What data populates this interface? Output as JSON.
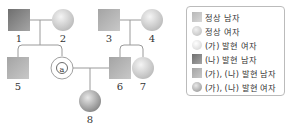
{
  "pedigree": {
    "individuals": [
      {
        "id": "1",
        "label": "1",
        "sex": "male",
        "phenotype": "(나) 발현 남자"
      },
      {
        "id": "2",
        "label": "2",
        "sex": "female",
        "phenotype": "정상 여자"
      },
      {
        "id": "3",
        "label": "3",
        "sex": "male",
        "phenotype": "(가), (나) 발현 남자"
      },
      {
        "id": "4",
        "label": "4",
        "sex": "female",
        "phenotype": "정상 여자"
      },
      {
        "id": "5",
        "label": "5",
        "sex": "male",
        "phenotype": "(가), (나) 발현 남자"
      },
      {
        "id": "a",
        "label": "ⓐ",
        "sex": "female",
        "phenotype": "unknown"
      },
      {
        "id": "6",
        "label": "6",
        "sex": "male",
        "phenotype": "(가), (나) 발현 남자"
      },
      {
        "id": "7",
        "label": "7",
        "sex": "female",
        "phenotype": "정상 여자"
      },
      {
        "id": "8",
        "label": "8",
        "sex": "female",
        "phenotype": "(가), (나) 발현 여자"
      }
    ],
    "marriages": [
      [
        "1",
        "2"
      ],
      [
        "3",
        "4"
      ],
      [
        "a",
        "6"
      ]
    ],
    "children": {
      "1-2": [
        "5",
        "a"
      ],
      "3-4": [
        "6",
        "7"
      ],
      "a-6": [
        "8"
      ]
    }
  },
  "legend": {
    "items": [
      {
        "label": "정상 남자",
        "shape": "square",
        "color": "#c8c8c8"
      },
      {
        "label": "정상 여자",
        "shape": "circle",
        "color": "#d0d0d0"
      },
      {
        "label": "(가) 발현 여자",
        "shape": "circle",
        "color": "#e6e6e6"
      },
      {
        "label": "(나) 발현 남자",
        "shape": "square",
        "color": "#8a8a8a"
      },
      {
        "label": "(가), (나) 발현 남자",
        "shape": "square",
        "color": "#b0b0b0"
      },
      {
        "label": "(가), (나) 발현 여자",
        "shape": "circle",
        "color": "#a8a8a8"
      }
    ]
  },
  "colors": {
    "line": "#9a9a9a",
    "dark_male": "#8a8a8a",
    "medium_male": "#b0b0b0",
    "normal_female": "#d4d4d4",
    "affected_female": "#a8a8a8"
  }
}
